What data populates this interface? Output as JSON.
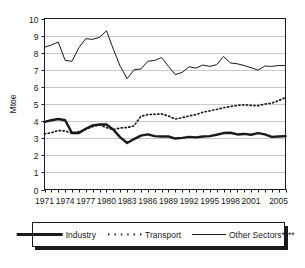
{
  "chart_data": {
    "type": "line",
    "title": "",
    "subtitle": "",
    "xlabel": "",
    "ylabel": "Mtoe",
    "ylim": [
      0,
      10
    ],
    "xlim": [
      1971,
      2006
    ],
    "grid": true,
    "grid_axis": "y",
    "legend_position": "bottom",
    "yticks": [
      "0",
      "1",
      "2",
      "3",
      "4",
      "5",
      "6",
      "7",
      "8",
      "9",
      "10"
    ],
    "xticks": [
      "1971",
      "1974",
      "1977",
      "1980",
      "1983",
      "1986",
      "1989",
      "1992",
      "1995",
      "1998",
      "2001",
      "2005"
    ],
    "x": [
      1971,
      1972,
      1973,
      1974,
      1975,
      1976,
      1977,
      1978,
      1979,
      1980,
      1981,
      1982,
      1983,
      1984,
      1985,
      1986,
      1987,
      1988,
      1989,
      1990,
      1991,
      1992,
      1993,
      1994,
      1995,
      1996,
      1997,
      1998,
      1999,
      2000,
      2001,
      2002,
      2003,
      2004,
      2005,
      2006
    ],
    "series": [
      {
        "name": "Industry",
        "style": "thick-solid",
        "color": "#1a1a1a",
        "values": [
          3.95,
          4.05,
          4.12,
          4.05,
          3.3,
          3.3,
          3.55,
          3.75,
          3.8,
          3.8,
          3.5,
          3.05,
          2.72,
          2.95,
          3.15,
          3.22,
          3.12,
          3.1,
          3.1,
          2.98,
          3.02,
          3.08,
          3.05,
          3.1,
          3.12,
          3.2,
          3.3,
          3.32,
          3.22,
          3.25,
          3.2,
          3.3,
          3.22,
          3.08,
          3.1,
          3.12
        ]
      },
      {
        "name": "Transport",
        "style": "dotted",
        "color": "#1a1a1a",
        "values": [
          3.25,
          3.32,
          3.45,
          3.42,
          3.3,
          3.38,
          3.52,
          3.68,
          3.78,
          3.62,
          3.5,
          3.6,
          3.62,
          3.72,
          4.28,
          4.38,
          4.4,
          4.42,
          4.3,
          4.12,
          4.2,
          4.3,
          4.38,
          4.52,
          4.6,
          4.68,
          4.78,
          4.85,
          4.92,
          4.95,
          4.92,
          4.9,
          5.0,
          5.05,
          5.2,
          5.38
        ]
      },
      {
        "name": "Other Sectors****",
        "style": "thin-solid",
        "color": "#1a1a1a",
        "values": [
          8.32,
          8.45,
          8.62,
          7.55,
          7.5,
          8.3,
          8.82,
          8.78,
          8.9,
          9.28,
          8.2,
          7.2,
          6.48,
          7.0,
          7.05,
          7.5,
          7.55,
          7.72,
          7.2,
          6.72,
          6.85,
          7.18,
          7.1,
          7.28,
          7.2,
          7.3,
          7.78,
          7.4,
          7.35,
          7.25,
          7.12,
          6.98,
          7.22,
          7.2,
          7.25,
          7.25
        ]
      }
    ]
  },
  "legend": {
    "entries": [
      {
        "label": "Industry",
        "style": "thick-solid"
      },
      {
        "label": "Transport",
        "style": "dotted"
      },
      {
        "label": "Other Sectors****",
        "style": "thin-solid"
      }
    ]
  }
}
